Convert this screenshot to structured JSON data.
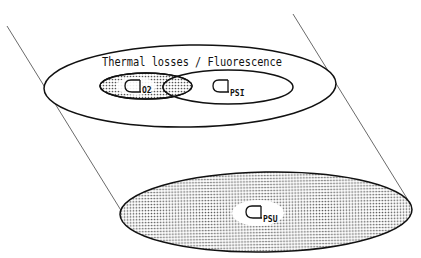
{
  "diagram": {
    "top_region": {
      "label": "Thermal losses / Fluorescence",
      "outer_ellipse": {
        "cx": 190,
        "cy": 86,
        "rx": 146,
        "ry": 41
      },
      "o2_ellipse": {
        "symbol_subscript": "O2",
        "cx": 146,
        "cy": 86,
        "rx": 46,
        "ry": 13
      },
      "psi_ellipse": {
        "symbol_subscript": "PSI",
        "cx": 228,
        "cy": 87,
        "rx": 65,
        "ry": 17
      }
    },
    "bottom_region": {
      "psu_ellipse": {
        "symbol_subscript": "PSU",
        "cx": 266,
        "cy": 212,
        "rx": 146,
        "ry": 40
      }
    },
    "projection_lines": [
      {
        "x1": 7,
        "y1": 26,
        "x2": 122,
        "y2": 212
      },
      {
        "x1": 293,
        "y1": 14,
        "x2": 408,
        "y2": 200
      }
    ],
    "colors": {
      "stroke": "#111111",
      "dot_fill": "#8a8a8a",
      "background": "#ffffff"
    }
  },
  "labels": {
    "title": "Thermal losses / Fluorescence",
    "o2_sub": "O2",
    "psi_sub": "PSI",
    "psu_sub": "PSU"
  }
}
